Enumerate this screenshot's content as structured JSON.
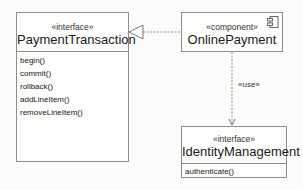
{
  "diagram": {
    "type": "UML component/interface diagram",
    "elements": {
      "payment_transaction": {
        "stereotype": "«interface»",
        "name": "PaymentTransaction",
        "operations": [
          "begin()",
          "commit()",
          "rollback()",
          "addLineItem()",
          "removeLineItem()"
        ]
      },
      "online_payment": {
        "stereotype": "«component»",
        "name": "OnlinePayment",
        "icon": "component-icon"
      },
      "identity_management": {
        "stereotype": "«interface»",
        "name": "IdentityManagement",
        "operations": [
          "authenticate()"
        ]
      }
    },
    "relationships": [
      {
        "from": "OnlinePayment",
        "to": "PaymentTransaction",
        "kind": "realization",
        "label": ""
      },
      {
        "from": "OnlinePayment",
        "to": "IdentityManagement",
        "kind": "dependency",
        "label": "«use»"
      }
    ],
    "colors": {
      "line": "#8d8d8d",
      "background": "#fcfcfb",
      "text": "#222222"
    }
  }
}
